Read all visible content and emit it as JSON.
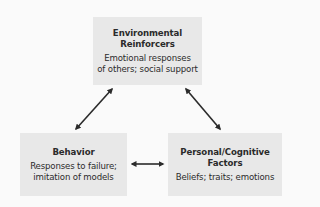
{
  "diagram": {
    "type": "triadic-reciprocal-causation",
    "colors": {
      "background": "#fafafa",
      "box_fill": "#e8e8e8",
      "text": "#2b2b2b",
      "arrow": "#2b2b2b"
    },
    "nodes": {
      "environmental": {
        "title_line1": "Environmental",
        "title_line2": "Reinforcers",
        "body_line1": "Emotional responses",
        "body_line2": "of others; social support"
      },
      "behavior": {
        "title_line1": "Behavior",
        "body_line1": "Responses to failure;",
        "body_line2": "imitation of models"
      },
      "personal": {
        "title_line1": "Personal/Cognitive",
        "title_line2": "Factors",
        "body_line1": "Beliefs; traits; emotions"
      }
    },
    "edges": [
      {
        "from": "environmental",
        "to": "behavior",
        "type": "bidirectional"
      },
      {
        "from": "environmental",
        "to": "personal",
        "type": "bidirectional"
      },
      {
        "from": "behavior",
        "to": "personal",
        "type": "bidirectional"
      }
    ]
  }
}
